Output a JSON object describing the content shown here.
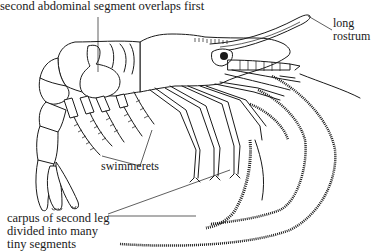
{
  "figure": {
    "labels": {
      "second_abdominal_segment": "second abdominal segment overlaps first",
      "rostrum": [
        "long",
        "rostrum"
      ],
      "swimmerets": "swimmerets",
      "carpus": [
        "carpus of second leg",
        "divided into many",
        "tiny segments"
      ]
    },
    "colors": {
      "ink": "#1a1a1a",
      "background": "#ffffff"
    }
  }
}
